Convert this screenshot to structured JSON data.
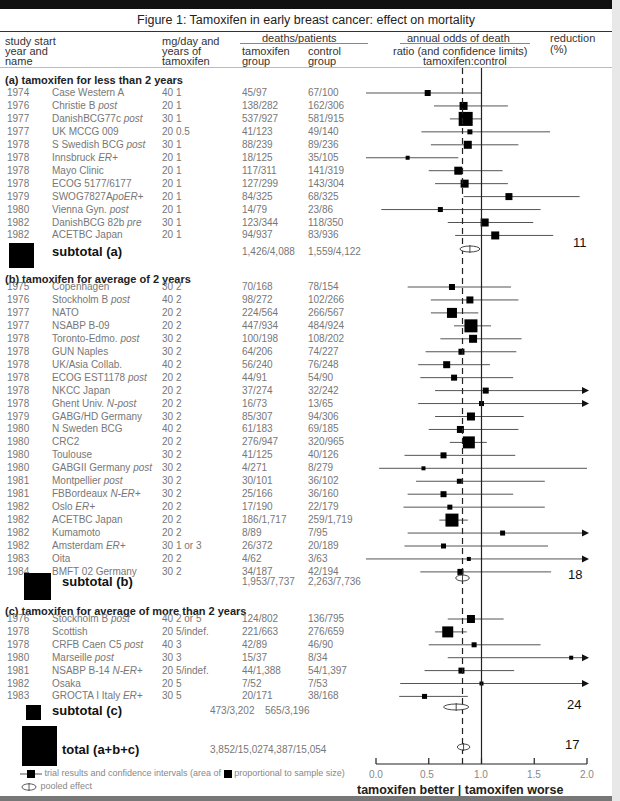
{
  "title": "Figure 1: Tamoxifen in early breast cancer: effect on mortality",
  "headers": {
    "study_line1": "study start",
    "study_line2": "year and",
    "study_line3": "name",
    "dose_line1": "mg/day and",
    "dose_line2": "years of",
    "dose_line3": "tamoxifen",
    "deaths": "deaths/patients",
    "tam_line1": "tamoxifen",
    "tam_line2": "group",
    "ctl_line1": "control",
    "ctl_line2": "group",
    "odds_line1": "annual odds of death",
    "odds_line2": "ratio (and confidence limits)",
    "odds_line3": "tamoxifen:control",
    "red_line1": "reduction",
    "red_line2": "(%)"
  },
  "sections": {
    "a": {
      "label": "(a) tamoxifen for less than 2 years",
      "subtotal_label": "subtotal (a)",
      "subtotal_tam": "1,426/4,088",
      "subtotal_ctl": "1,559/4,122",
      "reduction": "11"
    },
    "b": {
      "label": "(b) tamoxifen for average of 2 years",
      "subtotal_label": "subtotal (b)",
      "subtotal_tam": "1,953/7,737",
      "subtotal_ctl": "2,263/7,736",
      "reduction": "18"
    },
    "c": {
      "label": "(c) tamoxifen for average of more than 2 years",
      "subtotal_label": "subtotal (c)",
      "subtotal_tam": "473/3,202",
      "subtotal_ctl": "565/3,196",
      "reduction": "24"
    }
  },
  "total": {
    "label": "total (a+b+c)",
    "tam": "3,852/15,027",
    "ctl": "4,387/15,054",
    "reduction": "17"
  },
  "axis": {
    "ticks": [
      "0.0",
      "0.5",
      "1.0",
      "1.5",
      "2.0"
    ],
    "better": "tamoxifen better",
    "sep": "|",
    "worse": "tamoxifen worse"
  },
  "legend": {
    "trial": "trial results and confidence intervals (area of",
    "trial2": "proportional to sample size)",
    "pooled": "pooled effect"
  },
  "chart_data": {
    "type": "forest",
    "title": "Figure 1: Tamoxifen in early breast cancer: effect on mortality",
    "xlabel": "annual odds of death ratio (and confidence limits) tamoxifen:control",
    "xlim": [
      0,
      2
    ],
    "xticks": [
      0,
      0.5,
      1.0,
      1.5,
      2.0
    ],
    "reference_line": 1.0,
    "pooled_line": 0.82,
    "annotation": "tamoxifen better | tamoxifen worse",
    "rows": [
      {
        "group": "a",
        "year": "1974",
        "name": "Case Western A",
        "italic": "",
        "dose": "40 1",
        "tam": "45/97",
        "ctl": "67/100",
        "or": 0.49,
        "lo": 0.0,
        "hi": 1.0,
        "size": 6
      },
      {
        "group": "a",
        "year": "1976",
        "name": "Christie B ",
        "italic": "post",
        "dose": "20 1",
        "tam": "138/282",
        "ctl": "162/306",
        "or": 0.83,
        "lo": 0.55,
        "hi": 1.25,
        "size": 8
      },
      {
        "group": "a",
        "year": "1977",
        "name": "DanishBCG77c ",
        "italic": "post",
        "dose": "30 1",
        "tam": "537/927",
        "ctl": "581/915",
        "or": 0.85,
        "lo": 0.7,
        "hi": 1.0,
        "size": 14
      },
      {
        "group": "a",
        "year": "1977",
        "name": "UK MCCG 009",
        "italic": "",
        "dose": "20 0.5",
        "tam": "41/123",
        "ctl": "49/140",
        "or": 0.89,
        "lo": 0.43,
        "hi": 1.65,
        "size": 5
      },
      {
        "group": "a",
        "year": "1978",
        "name": "S Swedish BCG ",
        "italic": "post",
        "dose": "30 1",
        "tam": "88/239",
        "ctl": "89/236",
        "or": 0.87,
        "lo": 0.52,
        "hi": 1.35,
        "size": 8
      },
      {
        "group": "a",
        "year": "1978",
        "name": "Innsbruck ",
        "italic": "ER+",
        "dose": "20 1",
        "tam": "18/125",
        "ctl": "35/105",
        "or": 0.3,
        "lo": 0.0,
        "hi": 0.78,
        "size": 4
      },
      {
        "group": "a",
        "year": "1978",
        "name": "Mayo Clinic",
        "italic": "",
        "dose": "20 1",
        "tam": "117/311",
        "ctl": "141/319",
        "or": 0.78,
        "lo": 0.5,
        "hi": 1.2,
        "size": 8
      },
      {
        "group": "a",
        "year": "1978",
        "name": "ECOG 5177/6177",
        "italic": "",
        "dose": "20 1",
        "tam": "127/299",
        "ctl": "143/304",
        "or": 0.84,
        "lo": 0.56,
        "hi": 1.25,
        "size": 8
      },
      {
        "group": "a",
        "year": "1979",
        "name": "SWOG7827A",
        "italic": "poER+",
        "dose": "20 1",
        "tam": "84/325",
        "ctl": "68/325",
        "or": 1.26,
        "lo": 0.83,
        "hi": 1.93,
        "size": 7
      },
      {
        "group": "a",
        "year": "1980",
        "name": "Vienna Gyn. ",
        "italic": "post",
        "dose": "20 1",
        "tam": "14/79",
        "ctl": "23/86",
        "or": 0.61,
        "lo": 0.05,
        "hi": 1.56,
        "size": 5
      },
      {
        "group": "a",
        "year": "1982",
        "name": "DanishBCG 82b ",
        "italic": "pre",
        "dose": "30 1",
        "tam": "123/344",
        "ctl": "118/350",
        "or": 1.03,
        "lo": 0.68,
        "hi": 1.49,
        "size": 8
      },
      {
        "group": "a",
        "year": "1982",
        "name": "ACETBC Japan",
        "italic": "",
        "dose": "20 1",
        "tam": "94/937",
        "ctl": "83/936",
        "or": 1.13,
        "lo": 0.75,
        "hi": 1.68,
        "size": 8
      },
      {
        "group": "b",
        "year": "1975",
        "name": "Copenhagen",
        "italic": "",
        "dose": "30 2",
        "tam": "70/168",
        "ctl": "78/154",
        "or": 0.72,
        "lo": 0.3,
        "hi": 1.28,
        "size": 6
      },
      {
        "group": "b",
        "year": "1976",
        "name": "Stockholm B ",
        "italic": "post",
        "dose": "40 2",
        "tam": "98/272",
        "ctl": "102/266",
        "or": 0.89,
        "lo": 0.52,
        "hi": 1.35,
        "size": 7
      },
      {
        "group": "b",
        "year": "1977",
        "name": "NATO",
        "italic": "",
        "dose": "20 2",
        "tam": "224/564",
        "ctl": "266/567",
        "or": 0.72,
        "lo": 0.52,
        "hi": 0.97,
        "size": 10
      },
      {
        "group": "b",
        "year": "1977",
        "name": "NSABP B-09",
        "italic": "",
        "dose": "20 2",
        "tam": "447/934",
        "ctl": "484/924",
        "or": 0.9,
        "lo": 0.74,
        "hi": 1.09,
        "size": 13
      },
      {
        "group": "b",
        "year": "1978",
        "name": "Toronto-Edmo. ",
        "italic": "post",
        "dose": "30 2",
        "tam": "100/198",
        "ctl": "108/202",
        "or": 0.92,
        "lo": 0.61,
        "hi": 1.38,
        "size": 8
      },
      {
        "group": "b",
        "year": "1978",
        "name": "GUN Naples",
        "italic": "",
        "dose": "30 2",
        "tam": "64/206",
        "ctl": "74/227",
        "or": 0.81,
        "lo": 0.47,
        "hi": 1.33,
        "size": 6
      },
      {
        "group": "b",
        "year": "1978",
        "name": "UK/Asia Collab.",
        "italic": "",
        "dose": "40 2",
        "tam": "56/240",
        "ctl": "76/248",
        "or": 0.67,
        "lo": 0.4,
        "hi": 1.08,
        "size": 7
      },
      {
        "group": "b",
        "year": "1978",
        "name": "ECOG EST1178 ",
        "italic": "post",
        "dose": "20 2",
        "tam": "44/91",
        "ctl": "54/90",
        "or": 0.74,
        "lo": 0.42,
        "hi": 1.3,
        "size": 6
      },
      {
        "group": "b",
        "year": "1978",
        "name": "NKCC Japan",
        "italic": "",
        "dose": "20 2",
        "tam": "37/274",
        "ctl": "32/242",
        "or": 1.04,
        "lo": 0.56,
        "hi": 2.0,
        "size": 6,
        "arrow": true
      },
      {
        "group": "b",
        "year": "1978",
        "name": "Ghent Univ. ",
        "italic": "N-post",
        "dose": "20 2",
        "tam": "16/73",
        "ctl": "13/65",
        "or": 1.0,
        "lo": 0.4,
        "hi": 2.0,
        "size": 5,
        "arrow": true
      },
      {
        "group": "b",
        "year": "1979",
        "name": "GABG/HD Germany",
        "italic": "",
        "dose": "30 2",
        "tam": "85/307",
        "ctl": "94/306",
        "or": 0.9,
        "lo": 0.56,
        "hi": 1.4,
        "size": 8
      },
      {
        "group": "b",
        "year": "1980",
        "name": "N Sweden BCG",
        "italic": "",
        "dose": "40 2",
        "tam": "61/183",
        "ctl": "69/185",
        "or": 0.8,
        "lo": 0.5,
        "hi": 1.35,
        "size": 7
      },
      {
        "group": "b",
        "year": "1980",
        "name": "CRC2",
        "italic": "",
        "dose": "20 2",
        "tam": "276/947",
        "ctl": "320/965",
        "or": 0.88,
        "lo": 0.7,
        "hi": 1.05,
        "size": 12
      },
      {
        "group": "b",
        "year": "1980",
        "name": "Toulouse",
        "italic": "",
        "dose": "30 2",
        "tam": "41/125",
        "ctl": "40/126",
        "or": 0.64,
        "lo": 0.27,
        "hi": 1.32,
        "size": 6
      },
      {
        "group": "b",
        "year": "1980",
        "name": "GABGII Germany ",
        "italic": "post",
        "dose": "30 2",
        "tam": "4/271",
        "ctl": "8/279",
        "or": 0.45,
        "lo": 0.03,
        "hi": 2.0,
        "size": 4
      },
      {
        "group": "b",
        "year": "1981",
        "name": "Montpellier ",
        "italic": "post",
        "dose": "30 2",
        "tam": "30/101",
        "ctl": "36/102",
        "or": 0.79,
        "lo": 0.38,
        "hi": 1.6,
        "size": 5
      },
      {
        "group": "b",
        "year": "1981",
        "name": "FBBordeaux ",
        "italic": "N-ER+",
        "dose": "30 2",
        "tam": "25/166",
        "ctl": "36/160",
        "or": 0.64,
        "lo": 0.3,
        "hi": 1.3,
        "size": 6
      },
      {
        "group": "b",
        "year": "1982",
        "name": "Oslo ",
        "italic": "ER+",
        "dose": "20 2",
        "tam": "17/190",
        "ctl": "22/179",
        "or": 0.7,
        "lo": 0.26,
        "hi": 1.6,
        "size": 5
      },
      {
        "group": "b",
        "year": "1982",
        "name": "ACETBC Japan",
        "italic": "",
        "dose": "20 2",
        "tam": "186/1,717",
        "ctl": "259/1,719",
        "or": 0.72,
        "lo": 0.6,
        "hi": 0.87,
        "size": 13
      },
      {
        "group": "b",
        "year": "1982",
        "name": "Kumamoto",
        "italic": "",
        "dose": "20 2",
        "tam": "8/89",
        "ctl": "7/95",
        "or": 1.2,
        "lo": 0.3,
        "hi": 2.0,
        "size": 5,
        "arrow": true
      },
      {
        "group": "b",
        "year": "1982",
        "name": "Amsterdam ",
        "italic": "ER+",
        "dose": "30 1 or 3",
        "tam": "26/372",
        "ctl": "20/189",
        "or": 0.64,
        "lo": 0.27,
        "hi": 1.63,
        "size": 5
      },
      {
        "group": "b",
        "year": "1983",
        "name": "Oita",
        "italic": "",
        "dose": "20 2",
        "tam": "4/62",
        "ctl": "3/63",
        "or": 0.88,
        "lo": 0.0,
        "hi": 2.0,
        "size": 4,
        "arrow": true
      },
      {
        "group": "b",
        "year": "1984",
        "name": "BMFT 02 Germany",
        "italic": "",
        "dose": "30 2",
        "tam": "34/187",
        "ctl": "42/194",
        "or": 0.8,
        "lo": 0.42,
        "hi": 1.66,
        "size": 6
      },
      {
        "group": "c",
        "year": "1976",
        "name": "Stockholm B ",
        "italic": "post",
        "dose": "40 2 or 5",
        "tam": "124/802",
        "ctl": "136/795",
        "or": 0.9,
        "lo": 0.68,
        "hi": 1.21,
        "size": 8
      },
      {
        "group": "c",
        "year": "1978",
        "name": "Scottish",
        "italic": "",
        "dose": "20 5/indef.",
        "tam": "221/663",
        "ctl": "276/659",
        "or": 0.68,
        "lo": 0.56,
        "hi": 0.86,
        "size": 11
      },
      {
        "group": "c",
        "year": "1978",
        "name": "CRFB Caen C5 ",
        "italic": "post",
        "dose": "40 3",
        "tam": "42/89",
        "ctl": "46/90",
        "or": 0.93,
        "lo": 0.5,
        "hi": 1.56,
        "size": 5
      },
      {
        "group": "c",
        "year": "1980",
        "name": "Marseille ",
        "italic": "post",
        "dose": "30 3",
        "tam": "15/37",
        "ctl": "8/34",
        "or": 1.85,
        "lo": 0.68,
        "hi": 2.0,
        "size": 4,
        "arrow": true
      },
      {
        "group": "c",
        "year": "1981",
        "name": "NSABP B-14 ",
        "italic": "N-ER+",
        "dose": "20 5/indef.",
        "tam": "44/1,388",
        "ctl": "54/1,397",
        "or": 0.81,
        "lo": 0.46,
        "hi": 1.31,
        "size": 6
      },
      {
        "group": "c",
        "year": "1982",
        "name": "Osaka",
        "italic": "",
        "dose": "20 5",
        "tam": "7/52",
        "ctl": "7/53",
        "or": 1.0,
        "lo": 0.23,
        "hi": 2.0,
        "size": 4,
        "arrow": true
      },
      {
        "group": "c",
        "year": "1983",
        "name": "GROCTA I Italy ",
        "italic": "ER+",
        "dose": "30 5",
        "tam": "20/171",
        "ctl": "38/168",
        "or": 0.46,
        "lo": 0.22,
        "hi": 0.87,
        "size": 5
      }
    ],
    "pooled": [
      {
        "label": "subtotal (a)",
        "or": 0.89,
        "lo": 0.82,
        "hi": 0.97,
        "reduction": 11
      },
      {
        "label": "subtotal (b)",
        "or": 0.82,
        "lo": 0.78,
        "hi": 0.87,
        "reduction": 18
      },
      {
        "label": "subtotal (c)",
        "or": 0.76,
        "lo": 0.66,
        "hi": 0.86,
        "reduction": 24
      },
      {
        "label": "total (a+b+c)",
        "or": 0.83,
        "lo": 0.79,
        "hi": 0.87,
        "reduction": 17
      }
    ]
  }
}
